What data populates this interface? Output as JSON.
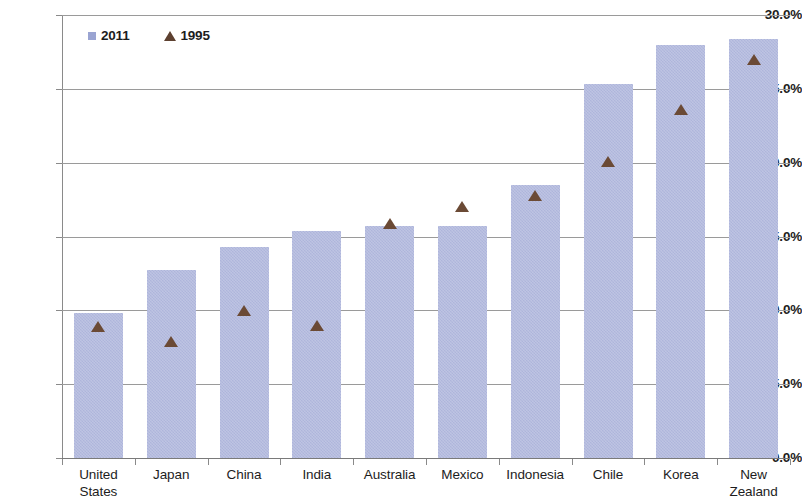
{
  "chart_data": {
    "type": "bar",
    "title": "",
    "xlabel": "",
    "ylabel": "",
    "ylim": [
      0,
      30
    ],
    "ytick_values": [
      0,
      5,
      10,
      15,
      20,
      25,
      30
    ],
    "ytick_labels": [
      "0.0%",
      "5.0%",
      "10.0%",
      "15.0%",
      "20.0%",
      "25.0%",
      "30.0%"
    ],
    "grid": true,
    "legend_position": "top-left",
    "categories": [
      "United States",
      "Japan",
      "China",
      "India",
      "Australia",
      "Mexico",
      "Indonesia",
      "Chile",
      "Korea",
      "New Zealand"
    ],
    "category_lines": [
      [
        "United",
        "States"
      ],
      [
        "Japan",
        ""
      ],
      [
        "China",
        ""
      ],
      [
        "India",
        ""
      ],
      [
        "Australia",
        ""
      ],
      [
        "Mexico",
        ""
      ],
      [
        "Indonesia",
        ""
      ],
      [
        "Chile",
        ""
      ],
      [
        "Korea",
        ""
      ],
      [
        "New Zealand",
        ""
      ]
    ],
    "series": [
      {
        "name": "2011",
        "kind": "bar",
        "color": "#b3bade",
        "values": [
          9.8,
          12.7,
          14.3,
          15.4,
          15.7,
          15.7,
          18.5,
          25.3,
          28.0,
          28.4
        ]
      },
      {
        "name": "1995",
        "kind": "marker",
        "marker": "triangle",
        "color": "#6b4a35",
        "values": [
          8.9,
          7.9,
          10.0,
          9.0,
          15.9,
          17.0,
          17.8,
          20.1,
          23.6,
          27.0
        ]
      }
    ]
  },
  "legend": {
    "items": [
      {
        "label": "2011",
        "swatch": "square-icon"
      },
      {
        "label": "1995",
        "swatch": "triangle-icon"
      }
    ]
  }
}
